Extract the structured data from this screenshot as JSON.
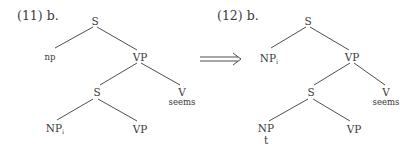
{
  "left_tree": {
    "example_label": "(11) b.",
    "nodes": {
      "root": "S",
      "np": "np",
      "vp": "VP",
      "s2": "S",
      "v": "V",
      "v_word": "seems",
      "np_i": "NP",
      "np_i_sub": "i",
      "vp2": "VP"
    }
  },
  "arrow": {
    "icon": "double-right-arrow-icon",
    "meaning": "derives"
  },
  "right_tree": {
    "example_label": "(12) b.",
    "nodes": {
      "root": "S",
      "np_i": "NP",
      "np_i_sub": "i",
      "vp": "VP",
      "s2": "S",
      "v": "V",
      "v_word": "seems",
      "np_trace": "NP",
      "trace": "t",
      "vp2": "VP"
    }
  },
  "colors": {
    "line": "#3a3a3a",
    "text": "#3a3a3a",
    "background": "#ffffff"
  }
}
